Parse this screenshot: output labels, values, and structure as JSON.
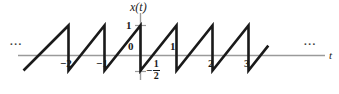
{
  "figure": {
    "title": "",
    "axis_labels": {
      "y_axis": "x(t)",
      "x_axis": "t"
    },
    "continuation_left": "...",
    "continuation_right": "..."
  },
  "labels": {
    "y_one": "1",
    "origin_zero": "0",
    "t_minus_two": "−2",
    "t_minus_one": "−1",
    "t_one": "1",
    "t_two": "2",
    "t_three": "3",
    "frac_minus": "−",
    "frac_numerator": "1",
    "frac_denominator": "2"
  },
  "colors": {
    "waveform": "#1a1a1a",
    "axis": "#9a9a9a",
    "text": "#1a1a1a",
    "background": "#ffffff"
  },
  "chart_data": {
    "type": "line",
    "title": "",
    "xlabel": "t",
    "ylabel": "x(t)",
    "xlim": [
      -3.2,
      3.6
    ],
    "ylim": [
      -0.85,
      1.25
    ],
    "grid": false,
    "legend": null,
    "waveform": {
      "period": 1,
      "amplitude_max": 1,
      "amplitude_min": -0.5,
      "slope": 1.5,
      "discontinuities_at_t": [
        -2,
        -1,
        0,
        1,
        2,
        3
      ]
    },
    "x_ticks": [
      -2,
      -1,
      1,
      2,
      3
    ],
    "x_tick_labels": [
      "−2",
      "−1",
      "1",
      "2",
      "3"
    ],
    "y_ticks": [
      -0.5,
      0,
      1
    ],
    "y_tick_labels": [
      "−1/2",
      "0",
      "1"
    ],
    "points": [
      {
        "t": -3.25,
        "x": -0.5
      },
      {
        "t": -2.0,
        "x": 1.0
      },
      {
        "t": -2.0,
        "x": -0.5
      },
      {
        "t": -1.0,
        "x": 1.0
      },
      {
        "t": -1.0,
        "x": -0.5
      },
      {
        "t": 0.0,
        "x": 1.0
      },
      {
        "t": 0.0,
        "x": -0.5
      },
      {
        "t": 1.0,
        "x": 1.0
      },
      {
        "t": 1.0,
        "x": -0.5
      },
      {
        "t": 2.0,
        "x": 1.0
      },
      {
        "t": 2.0,
        "x": -0.5
      },
      {
        "t": 3.0,
        "x": 1.0
      },
      {
        "t": 3.0,
        "x": -0.5
      },
      {
        "t": 3.55,
        "x": 0.33
      }
    ]
  }
}
